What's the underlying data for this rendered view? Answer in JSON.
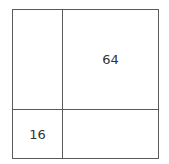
{
  "diagram": {
    "type": "area-model-grid",
    "cells": {
      "top_left": "",
      "top_right": "64",
      "bottom_left": "16",
      "bottom_right": ""
    },
    "line_color": "#5a5a5a"
  }
}
